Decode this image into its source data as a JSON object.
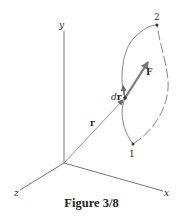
{
  "figure": {
    "caption": "Figure 3/8",
    "axes": {
      "x_label": "x",
      "y_label": "y",
      "z_label": "z"
    },
    "vectors": {
      "position_label": "r",
      "force_label": "F",
      "displacement_label_prefix": "d",
      "displacement_label_bold": "r"
    },
    "points": {
      "start_label": "1",
      "end_label": "2"
    },
    "colors": {
      "line": "#555555",
      "arrow": "#6e6e6e",
      "text": "#222222"
    }
  }
}
